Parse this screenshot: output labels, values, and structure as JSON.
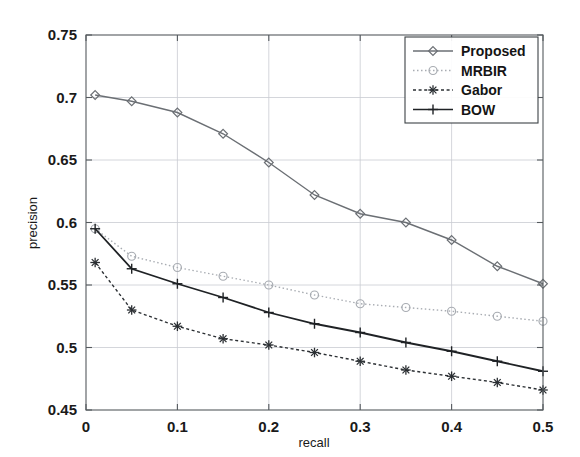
{
  "chart_data": {
    "type": "line",
    "title": "",
    "subtitle": "",
    "xlabel": "recall",
    "ylabel": "precision",
    "xlim": [
      0,
      0.5
    ],
    "ylim": [
      0.45,
      0.75
    ],
    "xticks": [
      "0",
      "0.1",
      "0.2",
      "0.3",
      "0.4",
      "0.5"
    ],
    "xtick_values": [
      0,
      0.1,
      0.2,
      0.3,
      0.4,
      0.5
    ],
    "yticks": [
      "0.45",
      "0.5",
      "0.55",
      "0.6",
      "0.65",
      "0.7",
      "0.75"
    ],
    "ytick_values": [
      0.45,
      0.5,
      0.55,
      0.6,
      0.65,
      0.7,
      0.75
    ],
    "grid": true,
    "legend_position": "top-right",
    "x": [
      0.01,
      0.05,
      0.1,
      0.15,
      0.2,
      0.25,
      0.3,
      0.35,
      0.4,
      0.45,
      0.5
    ],
    "series": [
      {
        "name": "Proposed",
        "marker": "diamond",
        "linestyle": "solid",
        "color": "#6b6f74",
        "values": [
          0.702,
          0.697,
          0.688,
          0.671,
          0.648,
          0.622,
          0.607,
          0.6,
          0.586,
          0.565,
          0.551
        ]
      },
      {
        "name": "MRBIR",
        "marker": "circle",
        "linestyle": "dashdot",
        "color": "#a8acb2",
        "values": [
          0.595,
          0.573,
          0.564,
          0.557,
          0.55,
          0.542,
          0.535,
          0.532,
          0.529,
          0.525,
          0.521
        ]
      },
      {
        "name": "Gabor",
        "marker": "asterisk",
        "linestyle": "dotted",
        "color": "#2b2f33",
        "values": [
          0.568,
          0.53,
          0.517,
          0.507,
          0.502,
          0.496,
          0.489,
          0.482,
          0.477,
          0.472,
          0.466
        ]
      },
      {
        "name": "BOW",
        "marker": "plus",
        "linestyle": "solid",
        "color": "#1f2225",
        "values": [
          0.595,
          0.563,
          0.551,
          0.54,
          0.528,
          0.519,
          0.512,
          0.504,
          0.497,
          0.489,
          0.481
        ]
      }
    ]
  },
  "legend": {
    "entries": [
      {
        "label": "Proposed"
      },
      {
        "label": "MRBIR"
      },
      {
        "label": "Gabor"
      },
      {
        "label": "BOW"
      }
    ]
  },
  "axes": {
    "x_axis_label": "recall",
    "y_axis_label": "precision"
  }
}
